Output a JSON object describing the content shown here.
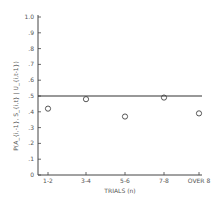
{
  "chart_data": {
    "type": "scatter",
    "title": "",
    "xlabel": "TRIALS (n)",
    "ylabel": "P(A_{i,-1}, S_{i,t} | U_{i,t-1})",
    "categories": [
      "1-2",
      "3-4",
      "5-6",
      "7-8",
      "OVER 8"
    ],
    "values": [
      0.42,
      0.48,
      0.37,
      0.49,
      0.39
    ],
    "reference_line": 0.5,
    "ylim": [
      0,
      1.0
    ],
    "yticks": [
      "0",
      ".1",
      ".2",
      ".3",
      ".4",
      ".5",
      ".6",
      ".7",
      ".8",
      ".9",
      "1.0"
    ],
    "grid": false,
    "legend": null
  }
}
